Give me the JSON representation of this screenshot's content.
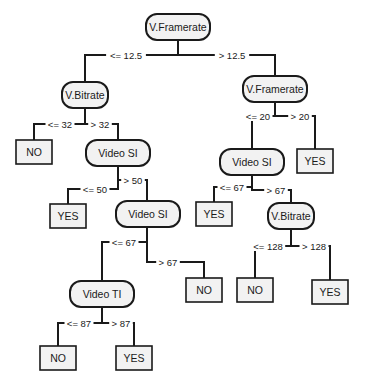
{
  "diagram": {
    "type": "decision-tree",
    "colors": {
      "line": "#1a1a1a",
      "node_fill": "#f2f2f2",
      "background": "#ffffff"
    },
    "decision_nodes": [
      {
        "id": "n0",
        "label": "V.Framerate",
        "x": 146,
        "y": 14,
        "w": 64,
        "h": 26
      },
      {
        "id": "n1",
        "label": "V.Bitrate",
        "x": 62,
        "y": 82,
        "w": 46,
        "h": 26
      },
      {
        "id": "n2",
        "label": "V.Framerate",
        "x": 243,
        "y": 76,
        "w": 64,
        "h": 26
      },
      {
        "id": "n3",
        "label": "Video SI",
        "x": 86,
        "y": 140,
        "w": 64,
        "h": 26
      },
      {
        "id": "n4",
        "label": "Video SI",
        "x": 116,
        "y": 201,
        "w": 64,
        "h": 26
      },
      {
        "id": "n5",
        "label": "Video SI",
        "x": 220,
        "y": 149,
        "w": 64,
        "h": 26
      },
      {
        "id": "n6",
        "label": "Video TI",
        "x": 70,
        "y": 281,
        "w": 64,
        "h": 26
      },
      {
        "id": "n7",
        "label": "V.Bitrate",
        "x": 268,
        "y": 203,
        "w": 46,
        "h": 26
      }
    ],
    "leaf_nodes": [
      {
        "id": "l0",
        "label": "NO",
        "x": 16,
        "y": 140,
        "w": 36,
        "h": 24
      },
      {
        "id": "l1",
        "label": "YES",
        "x": 50,
        "y": 204,
        "w": 36,
        "h": 24
      },
      {
        "id": "l2",
        "label": "NO",
        "x": 186,
        "y": 278,
        "w": 36,
        "h": 24
      },
      {
        "id": "l3",
        "label": "NO",
        "x": 40,
        "y": 346,
        "w": 36,
        "h": 24
      },
      {
        "id": "l4",
        "label": "YES",
        "x": 116,
        "y": 346,
        "w": 36,
        "h": 24
      },
      {
        "id": "l5",
        "label": "YES",
        "x": 297,
        "y": 149,
        "w": 36,
        "h": 24
      },
      {
        "id": "l6",
        "label": "YES",
        "x": 196,
        "y": 202,
        "w": 36,
        "h": 24
      },
      {
        "id": "l7",
        "label": "NO",
        "x": 237,
        "y": 278,
        "w": 36,
        "h": 24
      },
      {
        "id": "l8",
        "label": "YES",
        "x": 312,
        "y": 280,
        "w": 36,
        "h": 24
      }
    ],
    "edges": [
      {
        "label": "<= 12.5",
        "path": "M178 40 L178 55 L85 55 L85 82",
        "lx": 126,
        "ly": 55
      },
      {
        "label": "> 12.5",
        "path": "M178 55 L275 55 L275 76",
        "lx": 232,
        "ly": 55
      },
      {
        "label": "<= 32",
        "path": "M85 108 L85 124 L34 124 L34 140",
        "lx": 60,
        "ly": 124
      },
      {
        "label": "> 32",
        "path": "M85 124 L118 124 L118 140",
        "lx": 100,
        "ly": 124
      },
      {
        "label": "<= 50",
        "path": "M118 166 L118 189 L68 189 L68 204",
        "lx": 95,
        "ly": 189
      },
      {
        "label": "> 50",
        "path": "M118 180 L147 180 L147 201",
        "lx": 133,
        "ly": 180
      },
      {
        "label": "<= 67",
        "path": "M147 227 L147 242 L102 242 L102 281",
        "lx": 124,
        "ly": 242
      },
      {
        "label": "> 67",
        "path": "M147 242 L147 262 L204 262 L204 278",
        "lx": 168,
        "ly": 262
      },
      {
        "label": "<= 87",
        "path": "M102 307 L102 323 L58 323 L58 346",
        "lx": 79,
        "ly": 323
      },
      {
        "label": "> 87",
        "path": "M102 323 L134 323 L134 346",
        "lx": 121,
        "ly": 323
      },
      {
        "label": "<= 20",
        "path": "M275 102 L275 116 L252 116 L252 149",
        "lx": 258,
        "ly": 116
      },
      {
        "label": "> 20",
        "path": "M275 116 L315 116 L315 149",
        "lx": 300,
        "ly": 116
      },
      {
        "label": "<= 67",
        "path": "M252 175 L252 187 L214 187 L214 202",
        "lx": 232,
        "ly": 187
      },
      {
        "label": "> 67",
        "path": "M252 187 L252 190 L291 190 L291 203",
        "lx": 276,
        "ly": 190
      },
      {
        "label": "<= 128",
        "path": "M291 229 L291 246 L255 246 L255 278",
        "lx": 268,
        "ly": 246
      },
      {
        "label": "> 128",
        "path": "M291 246 L330 246 L330 280",
        "lx": 314,
        "ly": 246
      }
    ]
  }
}
